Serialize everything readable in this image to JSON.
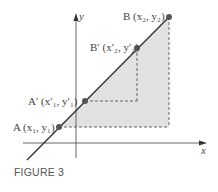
{
  "figure": {
    "caption": "FIGURE 3",
    "axes": {
      "x_label": "x",
      "y_label": "y"
    },
    "points": [
      {
        "id": "A",
        "label": "A (x₁, y₁)"
      },
      {
        "id": "A_prime",
        "label": "A′ (x′₁, y′₁)"
      },
      {
        "id": "B_prime",
        "label": "B′ (x′₂, y′₂)"
      },
      {
        "id": "B",
        "label": "B (x₂, y₂)"
      }
    ],
    "colors": {
      "shade": "#dcdcdc",
      "line": "#3a3a3a",
      "point": "#555555"
    }
  }
}
